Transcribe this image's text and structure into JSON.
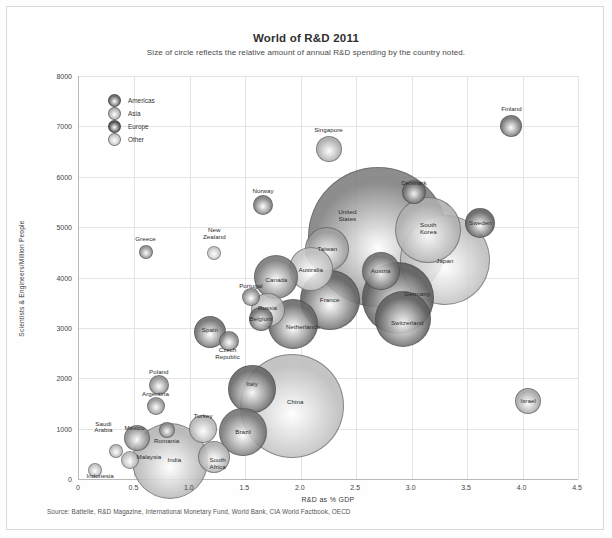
{
  "figure": {
    "title": "World of R&D 2011",
    "subtitle": "Size of circle reflects the relative amount of annual R&D spending by the country noted.",
    "source": "Source: Battelle, R&D Magazine, International Monetary Fund, World Bank, CIA World Factbook, OECD"
  },
  "legend": {
    "position": "inside-top-left",
    "items": [
      {
        "label": "Americas",
        "color": "#6e6e6e"
      },
      {
        "label": "Asia",
        "color": "#b5b5b5"
      },
      {
        "label": "Europe",
        "color": "#585858"
      },
      {
        "label": "Other",
        "color": "#c9c9c9"
      }
    ]
  },
  "chart_data": {
    "type": "scatter",
    "title": "World of R&D 2011",
    "subtitle": "Size of circle reflects the relative amount of annual R&D spending by the country noted.",
    "xlabel": "R&D as % GDP",
    "ylabel": "Scientists & Engineers/Million People",
    "xlim": [
      0,
      4.5
    ],
    "ylim": [
      0,
      8000
    ],
    "xticks": [
      "0",
      "0.5",
      "1.0",
      "1.5",
      "2.0",
      "2.5",
      "3.0",
      "3.5",
      "4.0",
      "4.5"
    ],
    "yticks": [
      "0",
      "1000",
      "2000",
      "3000",
      "4000",
      "5000",
      "6000",
      "7000",
      "8000"
    ],
    "grid": true,
    "size_meaning": "relative annual R&D spending",
    "points": [
      {
        "label": "Finland",
        "x": 3.9,
        "y": 7000,
        "r": 11,
        "group": "Europe",
        "color": "#707070",
        "lx": 3.9,
        "ly": 7340
      },
      {
        "label": "Singapore",
        "x": 2.25,
        "y": 6550,
        "r": 13,
        "group": "Asia",
        "color": "#a8a8a8",
        "lx": 2.25,
        "ly": 6930
      },
      {
        "label": "Denmark",
        "x": 3.02,
        "y": 5700,
        "r": 12,
        "group": "Europe",
        "color": "#6b6b6b",
        "lx": 3.02,
        "ly": 5880
      },
      {
        "label": "Norway",
        "x": 1.66,
        "y": 5430,
        "r": 10,
        "group": "Europe",
        "color": "#787878",
        "lx": 1.66,
        "ly": 5720
      },
      {
        "label": "United States",
        "x": 2.7,
        "y": 4800,
        "r": 70,
        "group": "Americas",
        "color": "#7e7e7e",
        "lx": 2.42,
        "ly": 5220
      },
      {
        "label": "Sweden",
        "x": 3.62,
        "y": 5080,
        "r": 15,
        "group": "Europe",
        "color": "#5e5e5e",
        "lx": 3.62,
        "ly": 5080
      },
      {
        "label": "South Korea",
        "x": 3.15,
        "y": 4950,
        "r": 33,
        "group": "Asia",
        "color": "#b0b0b0",
        "lx": 3.15,
        "ly": 4960
      },
      {
        "label": "Japan",
        "x": 3.3,
        "y": 4350,
        "r": 45,
        "group": "Asia",
        "color": "#bdbdbd",
        "lx": 3.3,
        "ly": 4320
      },
      {
        "label": "Taiwan",
        "x": 2.24,
        "y": 4560,
        "r": 22,
        "group": "Asia",
        "color": "#9f9f9f",
        "lx": 2.24,
        "ly": 4560
      },
      {
        "label": "Greece",
        "x": 0.6,
        "y": 4500,
        "r": 7,
        "group": "Europe",
        "color": "#8a8a8a",
        "lx": 0.6,
        "ly": 4760
      },
      {
        "label": "New Zealand",
        "x": 1.22,
        "y": 4480,
        "r": 7,
        "group": "Other",
        "color": "#c6c6c6",
        "lx": 1.22,
        "ly": 4860
      },
      {
        "label": "Australia",
        "x": 2.09,
        "y": 4170,
        "r": 22,
        "group": "Other",
        "color": "#c2c2c2",
        "lx": 2.09,
        "ly": 4150
      },
      {
        "label": "Austria",
        "x": 2.72,
        "y": 4120,
        "r": 19,
        "group": "Europe",
        "color": "#6d6d6d",
        "lx": 2.72,
        "ly": 4120
      },
      {
        "label": "Canada",
        "x": 1.78,
        "y": 4010,
        "r": 22,
        "group": "Americas",
        "color": "#767676",
        "lx": 1.78,
        "ly": 3960
      },
      {
        "label": "Germany",
        "x": 2.88,
        "y": 3600,
        "r": 36,
        "group": "Europe",
        "color": "#5b5b5b",
        "lx": 3.05,
        "ly": 3680
      },
      {
        "label": "France",
        "x": 2.26,
        "y": 3560,
        "r": 30,
        "group": "Europe",
        "color": "#636363",
        "lx": 2.26,
        "ly": 3560
      },
      {
        "label": "Portugal",
        "x": 1.55,
        "y": 3620,
        "r": 9,
        "group": "Europe",
        "color": "#8b8b8b",
        "lx": 1.55,
        "ly": 3830
      },
      {
        "label": "Russia",
        "x": 1.7,
        "y": 3350,
        "r": 17,
        "group": "Other",
        "color": "#b8b8b8",
        "lx": 1.7,
        "ly": 3400
      },
      {
        "label": "Belgium",
        "x": 1.64,
        "y": 3180,
        "r": 12,
        "group": "Europe",
        "color": "#6f6f6f",
        "lx": 1.64,
        "ly": 3180
      },
      {
        "label": "Switzerland",
        "x": 2.92,
        "y": 3170,
        "r": 28,
        "group": "Europe",
        "color": "#5f5f5f",
        "lx": 2.96,
        "ly": 3100
      },
      {
        "label": "Netherlands",
        "x": 1.93,
        "y": 3070,
        "r": 25,
        "group": "Europe",
        "color": "#666666",
        "lx": 2.02,
        "ly": 3020
      },
      {
        "label": "Spain",
        "x": 1.18,
        "y": 2920,
        "r": 16,
        "group": "Europe",
        "color": "#6a6a6a",
        "lx": 1.18,
        "ly": 2960
      },
      {
        "label": "Czech Republic",
        "x": 1.35,
        "y": 2740,
        "r": 10,
        "group": "Europe",
        "color": "#838383",
        "lx": 1.34,
        "ly": 2480
      },
      {
        "label": "Poland",
        "x": 0.72,
        "y": 1870,
        "r": 10,
        "group": "Europe",
        "color": "#8d8d8d",
        "lx": 0.72,
        "ly": 2120
      },
      {
        "label": "Italy",
        "x": 1.56,
        "y": 1790,
        "r": 24,
        "group": "Europe",
        "color": "#646464",
        "lx": 1.56,
        "ly": 1880
      },
      {
        "label": "China",
        "x": 1.92,
        "y": 1450,
        "r": 52,
        "group": "Asia",
        "color": "#bcbcbc",
        "lx": 1.95,
        "ly": 1520
      },
      {
        "label": "Argentina",
        "x": 0.69,
        "y": 1440,
        "r": 9,
        "group": "Americas",
        "color": "#8f8f8f",
        "lx": 0.69,
        "ly": 1680
      },
      {
        "label": "Israel",
        "x": 4.05,
        "y": 1550,
        "r": 13,
        "group": "Other",
        "color": "#a3a3a3",
        "lx": 4.05,
        "ly": 1550
      },
      {
        "label": "Turkey",
        "x": 1.12,
        "y": 1000,
        "r": 14,
        "group": "Other",
        "color": "#b4b4b4",
        "lx": 1.12,
        "ly": 1260
      },
      {
        "label": "Brazil",
        "x": 1.48,
        "y": 930,
        "r": 24,
        "group": "Americas",
        "color": "#737373",
        "lx": 1.48,
        "ly": 940
      },
      {
        "label": "Romania",
        "x": 0.79,
        "y": 970,
        "r": 8,
        "group": "Europe",
        "color": "#8c8c8c",
        "lx": 0.79,
        "ly": 760
      },
      {
        "label": "Mexico",
        "x": 0.52,
        "y": 820,
        "r": 13,
        "group": "Americas",
        "color": "#8a8a8a",
        "lx": 0.5,
        "ly": 1020
      },
      {
        "label": "Saudi Arabia",
        "x": 0.33,
        "y": 560,
        "r": 7,
        "group": "Other",
        "color": "#b7b7b7",
        "lx": 0.22,
        "ly": 1020
      },
      {
        "label": "Malaysia",
        "x": 0.46,
        "y": 380,
        "r": 9,
        "group": "Asia",
        "color": "#b9b9b9",
        "lx": 0.63,
        "ly": 430
      },
      {
        "label": "India",
        "x": 0.82,
        "y": 350,
        "r": 38,
        "group": "Asia",
        "color": "#b3b3b3",
        "lx": 0.86,
        "ly": 370
      },
      {
        "label": "South Africa",
        "x": 1.22,
        "y": 430,
        "r": 16,
        "group": "Other",
        "color": "#aeaeae",
        "lx": 1.25,
        "ly": 300
      },
      {
        "label": "Indonesia",
        "x": 0.14,
        "y": 180,
        "r": 7,
        "group": "Asia",
        "color": "#bfbfbf",
        "lx": 0.19,
        "ly": 50
      }
    ]
  }
}
